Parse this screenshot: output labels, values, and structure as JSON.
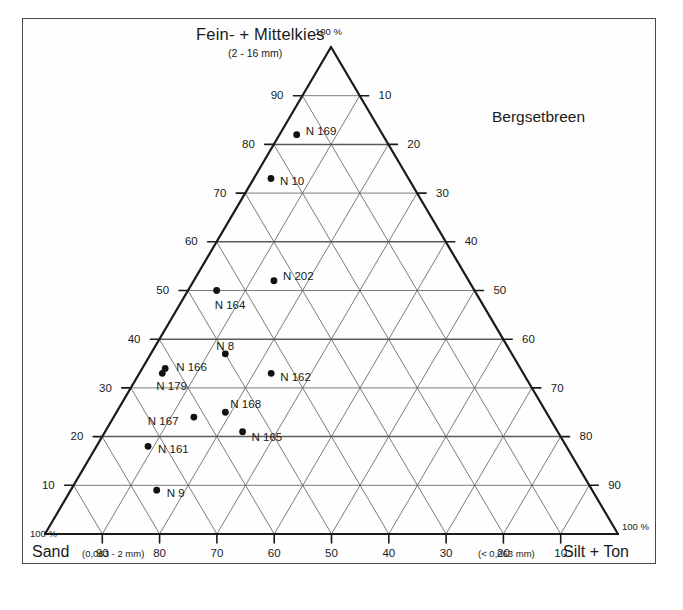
{
  "chart_data": {
    "type": "scatter",
    "title": "Bergsetbreen",
    "subtype": "ternary",
    "apex_label": "Fein- + Mittelkies",
    "apex_sublabel": "(2 - 16 mm)",
    "left_axis_label": "Sand",
    "left_axis_sublabel": "(0,063 - 2 mm)",
    "right_axis_label": "Silt + Ton",
    "right_axis_sublabel": "(< 0,063 mm)",
    "corner_top": "100 %",
    "corner_bottom_left": "100 %",
    "corner_bottom_right": "100 %",
    "grid": true,
    "tick_step": 10,
    "axis_range": [
      0,
      100
    ],
    "apex_ticks": [
      "90",
      "80",
      "70",
      "60",
      "50",
      "40",
      "30",
      "20",
      "10"
    ],
    "right_ticks": [
      "10",
      "20",
      "30",
      "40",
      "50",
      "60",
      "70",
      "80",
      "90"
    ],
    "bottom_ticks": [
      "90",
      "80",
      "70",
      "60",
      "50",
      "40",
      "30",
      "20",
      "10"
    ],
    "units": "percent",
    "points": [
      {
        "label": "N 169",
        "gravel": 82,
        "sand": 15,
        "silt": 3,
        "label_dx": 9,
        "label_dy": -4
      },
      {
        "label": "N 10",
        "gravel": 73,
        "sand": 24,
        "silt": 3,
        "label_dx": 9,
        "label_dy": 3
      },
      {
        "label": "N 202",
        "gravel": 52,
        "sand": 34,
        "silt": 14,
        "label_dx": 9,
        "label_dy": -5
      },
      {
        "label": "N 164",
        "gravel": 50,
        "sand": 45,
        "silt": 5,
        "label_dx": -2,
        "label_dy": 14
      },
      {
        "label": "N 8",
        "gravel": 37,
        "sand": 50,
        "silt": 13,
        "label_dx": -9,
        "label_dy": -8
      },
      {
        "label": "N 162",
        "gravel": 33,
        "sand": 44,
        "silt": 23,
        "label_dx": 9,
        "label_dy": 4
      },
      {
        "label": "N 166",
        "gravel": 34,
        "sand": 62,
        "silt": 4,
        "label_dx": 11,
        "label_dy": -1
      },
      {
        "label": "N 179",
        "gravel": 33,
        "sand": 63,
        "silt": 4,
        "label_dx": -6,
        "label_dy": 13
      },
      {
        "label": "N 168",
        "gravel": 25,
        "sand": 56,
        "silt": 19,
        "label_dx": 5,
        "label_dy": -8
      },
      {
        "label": "N 167",
        "gravel": 24,
        "sand": 62,
        "silt": 14,
        "label_dx": -46,
        "label_dy": 4
      },
      {
        "label": "N 165",
        "gravel": 21,
        "sand": 55,
        "silt": 24,
        "label_dx": 9,
        "label_dy": 5
      },
      {
        "label": "N 161",
        "gravel": 18,
        "sand": 73,
        "silt": 9,
        "label_dx": 10,
        "label_dy": 3
      },
      {
        "label": "N 9",
        "gravel": 9,
        "sand": 76,
        "silt": 15,
        "label_dx": 10,
        "label_dy": 3
      }
    ]
  },
  "colors": {
    "axis": "#1a1a1a",
    "grid": "#5a5a5a",
    "point": "#111111",
    "frame": "#4a4a4a",
    "background": "#ffffff"
  }
}
